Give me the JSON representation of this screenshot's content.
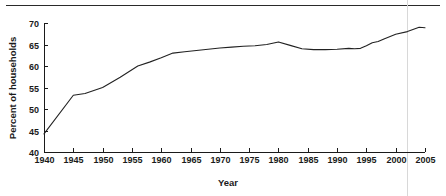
{
  "chart_data": {
    "type": "line",
    "title": "",
    "xlabel": "Year",
    "ylabel": "Percent of households",
    "xlim": [
      1940,
      2005
    ],
    "ylim": [
      40,
      70
    ],
    "grid": false,
    "legend": null,
    "xticks": [
      1940,
      1945,
      1950,
      1955,
      1960,
      1965,
      1970,
      1975,
      1980,
      1985,
      1990,
      1995,
      2000,
      2005
    ],
    "xtick_labels": [
      "1940",
      "1945",
      "1950",
      "1955",
      "1960",
      "1965",
      "1970",
      "1975",
      "1980",
      "1985",
      "1990",
      "1995",
      "2000",
      "2005"
    ],
    "yticks": [
      40,
      45,
      50,
      55,
      60,
      65,
      70
    ],
    "ytick_labels": [
      "40",
      "45",
      "50",
      "55",
      "60",
      "65",
      "70"
    ],
    "series": [
      {
        "name": "Percent of households",
        "color": "#222222",
        "x": [
          1940,
          1945,
          1947,
          1950,
          1953,
          1956,
          1958,
          1960,
          1962,
          1964,
          1966,
          1968,
          1970,
          1972,
          1974,
          1976,
          1978,
          1980,
          1982,
          1984,
          1986,
          1988,
          1990,
          1992,
          1993,
          1994,
          1995,
          1996,
          1997,
          1998,
          2000,
          2002,
          2004,
          2005
        ],
        "values": [
          44.2,
          53.2,
          53.6,
          55.0,
          57.4,
          60.0,
          60.9,
          61.9,
          63.0,
          63.3,
          63.6,
          63.9,
          64.2,
          64.4,
          64.6,
          64.7,
          65.0,
          65.6,
          64.8,
          64.0,
          63.8,
          63.8,
          63.9,
          64.1,
          64.0,
          64.1,
          64.7,
          65.4,
          65.7,
          66.3,
          67.4,
          68.0,
          69.0,
          68.9
        ]
      }
    ],
    "annotations": []
  },
  "layout": {
    "plot_left": 44,
    "plot_right": 425,
    "plot_top": 23,
    "plot_bottom": 152
  }
}
